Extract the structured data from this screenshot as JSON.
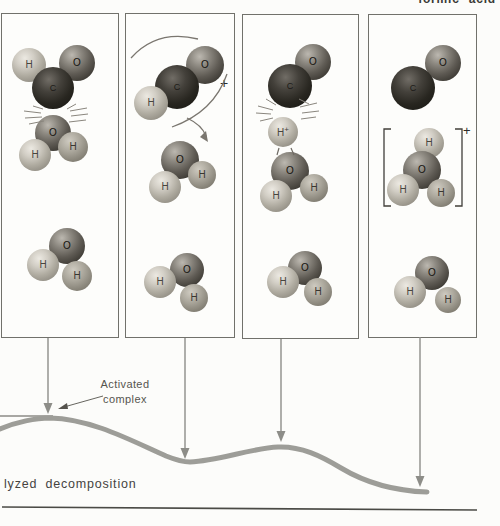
{
  "header": {
    "top_label_clipped": "formic acid"
  },
  "panels": [
    {
      "atoms": [
        "O",
        "H",
        "C",
        "O",
        "H",
        "H",
        "O",
        "H",
        "H"
      ]
    },
    {
      "atoms": [
        "O",
        "C",
        "H",
        "O",
        "H",
        "H",
        "O",
        "H",
        "H"
      ],
      "rotation_charge": "+"
    },
    {
      "atoms": [
        "O",
        "C",
        "H",
        "O",
        "H",
        "H",
        "O",
        "H",
        "H"
      ],
      "proton_charge": "+"
    },
    {
      "atoms": [
        "O",
        "C",
        "H",
        "O",
        "H",
        "H",
        "H",
        "O",
        "H"
      ],
      "complex_charge": "+"
    }
  ],
  "annotations": {
    "activated_line1": "Activated",
    "activated_line2": "complex",
    "caption": "lyzed decomposition"
  },
  "colors": {
    "energy_curve": "#9d9d98",
    "arrow": "#8d8d88",
    "rule": "#4a4a45"
  }
}
